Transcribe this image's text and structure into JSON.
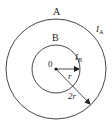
{
  "diagram": {
    "outer_circle": {
      "label": "A",
      "current_label": "I",
      "current_sub": "A",
      "radius_label": "2r"
    },
    "inner_circle": {
      "label": "B",
      "current_label": "I",
      "current_sub": "B",
      "radius_label": "r"
    },
    "center_label": "0",
    "colors": {
      "stroke": "#222222",
      "background": "#ffffff"
    }
  }
}
